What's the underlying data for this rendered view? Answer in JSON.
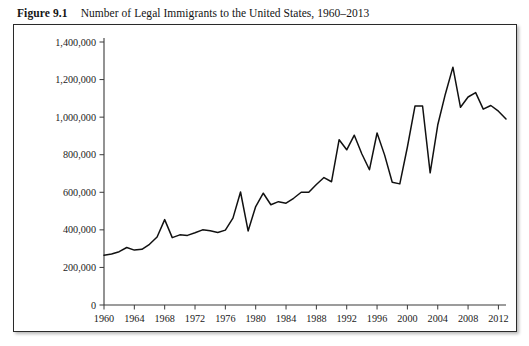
{
  "figure": {
    "label": "Figure 9.1",
    "caption": "Number of  Legal Immigrants to the United States, 1960–2013"
  },
  "chart_data": {
    "type": "line",
    "title": "Number of  Legal Immigrants to the United States, 1960–2013",
    "xlabel": "",
    "ylabel": "",
    "xlim": [
      1960,
      2013
    ],
    "ylim": [
      0,
      1400000
    ],
    "grid": false,
    "legend": null,
    "line_color": "#111111",
    "x_ticks": [
      1960,
      1964,
      1968,
      1972,
      1976,
      1980,
      1984,
      1988,
      1992,
      1996,
      2000,
      2004,
      2008,
      2012
    ],
    "x_tick_labels": [
      "1960",
      "1964",
      "1968",
      "1972",
      "1976",
      "1980",
      "1984",
      "1988",
      "1992",
      "1996",
      "2000",
      "2004",
      "2008",
      "2012"
    ],
    "y_ticks": [
      0,
      200000,
      400000,
      600000,
      800000,
      1000000,
      1200000,
      1400000
    ],
    "y_tick_labels": [
      "0",
      "200,000",
      "400,000",
      "600,000",
      "800,000",
      "1,000,000",
      "1,200,000",
      "1,400,000"
    ],
    "x": [
      1960,
      1961,
      1962,
      1963,
      1964,
      1965,
      1966,
      1967,
      1968,
      1969,
      1970,
      1971,
      1972,
      1973,
      1974,
      1975,
      1976,
      1977,
      1978,
      1979,
      1980,
      1981,
      1982,
      1983,
      1984,
      1985,
      1986,
      1987,
      1988,
      1989,
      1990,
      1991,
      1992,
      1993,
      1994,
      1995,
      1996,
      1997,
      1998,
      1999,
      2000,
      2001,
      2002,
      2003,
      2004,
      2005,
      2006,
      2007,
      2008,
      2009,
      2010,
      2011,
      2012,
      2013
    ],
    "values": [
      265398,
      271344,
      283763,
      306260,
      292248,
      296697,
      323040,
      361972,
      454448,
      358579,
      373326,
      370478,
      384685,
      400063,
      394861,
      386194,
      398613,
      462315,
      601442,
      394244,
      524295,
      595014,
      533624,
      550052,
      541811,
      568149,
      600027,
      599889,
      641346,
      678459,
      656111,
      880014,
      826059,
      903916,
      803993,
      720177,
      915560,
      797847,
      653206,
      644787,
      841002,
      1058902,
      1059356,
      703542,
      957883,
      1122257,
      1266129,
      1052415,
      1107126,
      1130818,
      1042625,
      1062040,
      1031631,
      990553
    ],
    "series": [
      {
        "name": "Legal immigrants admitted",
        "values": [
          265398,
          271344,
          283763,
          306260,
          292248,
          296697,
          323040,
          361972,
          454448,
          358579,
          373326,
          370478,
          384685,
          400063,
          394861,
          386194,
          398613,
          462315,
          601442,
          394244,
          524295,
          595014,
          533624,
          550052,
          541811,
          568149,
          600027,
          599889,
          641346,
          678459,
          656111,
          880014,
          826059,
          903916,
          803993,
          720177,
          915560,
          797847,
          653206,
          644787,
          841002,
          1058902,
          1059356,
          703542,
          957883,
          1122257,
          1266129,
          1052415,
          1107126,
          1130818,
          1042625,
          1062040,
          1031631,
          990553
        ]
      }
    ]
  }
}
